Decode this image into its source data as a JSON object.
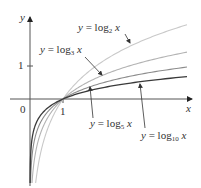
{
  "chart_data": {
    "type": "line",
    "title": "",
    "xlabel": "x",
    "ylabel": "y",
    "x_ticks": [
      "0",
      "1"
    ],
    "y_ticks": [
      "1"
    ],
    "xlim": [
      0,
      4.9
    ],
    "ylim": [
      -2.5,
      2.5
    ],
    "grid": false,
    "legend": "inline annotations with arrows",
    "series": [
      {
        "name": "y = log2 x",
        "base": 2,
        "color": "#c9c9c9",
        "points": [
          [
            0.06,
            -4.06
          ],
          [
            0.25,
            -2
          ],
          [
            0.5,
            -1
          ],
          [
            1,
            0
          ],
          [
            2,
            1
          ],
          [
            4,
            2
          ],
          [
            4.76,
            2.25
          ]
        ]
      },
      {
        "name": "y = log3 x",
        "base": 3,
        "color": "#b3b3b3",
        "points": [
          [
            0.05,
            -2.73
          ],
          [
            0.33,
            -1
          ],
          [
            1,
            0
          ],
          [
            3,
            1
          ],
          [
            4.76,
            1.42
          ]
        ]
      },
      {
        "name": "y = log5 x",
        "base": 5,
        "color": "#8c8c8c",
        "points": [
          [
            0.04,
            -2
          ],
          [
            0.2,
            -1
          ],
          [
            1,
            0
          ],
          [
            4.76,
            0.97
          ]
        ]
      },
      {
        "name": "y = log10 x",
        "base": 10,
        "color": "#3a3a3a",
        "points": [
          [
            0.02,
            -1.7
          ],
          [
            0.1,
            -1
          ],
          [
            1,
            0
          ],
          [
            4.76,
            0.68
          ]
        ]
      }
    ],
    "annotations": [
      {
        "text": "y = log2 x",
        "points_to": "log2 curve"
      },
      {
        "text": "y = log3 x",
        "points_to": "log3 curve"
      },
      {
        "text": "y = log5 x",
        "points_to": "log5 curve"
      },
      {
        "text": "y = log10 x",
        "points_to": "log10 curve"
      }
    ]
  },
  "axes": {
    "x_name": "x",
    "y_name": "y",
    "origin_label": "0",
    "x_tick_1": "1",
    "y_tick_1": "1"
  },
  "labels": {
    "log2": {
      "y": "y",
      "eq": "= log",
      "sub": "2",
      "x": "x"
    },
    "log3": {
      "y": "y",
      "eq": "= log",
      "sub": "3",
      "x": "x"
    },
    "log5": {
      "y": "y",
      "eq": "= log",
      "sub": "5",
      "x": "x"
    },
    "log10": {
      "y": "y",
      "eq": "= log",
      "sub": "10",
      "x": "x"
    }
  }
}
